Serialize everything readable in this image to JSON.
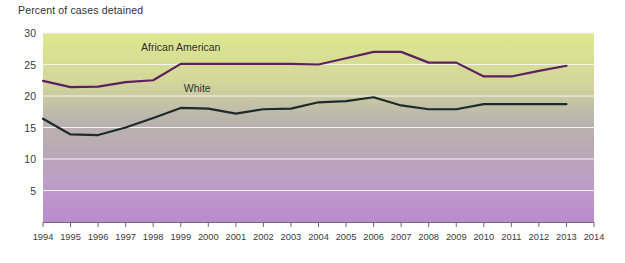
{
  "chart_data": {
    "type": "line",
    "title": "Percent of cases detained",
    "xlabel": "",
    "ylabel": "Percent of cases detained",
    "grid": true,
    "legend_position": "inline-labels",
    "xlim": [
      1994,
      2014
    ],
    "ylim": [
      0,
      30
    ],
    "yticks": [
      5,
      10,
      15,
      20,
      25,
      30
    ],
    "ytick_labels": [
      "5",
      "10",
      "15",
      "20",
      "25",
      "30"
    ],
    "x": [
      1994,
      1995,
      1996,
      1997,
      1998,
      1999,
      2000,
      2001,
      2002,
      2003,
      2004,
      2005,
      2006,
      2007,
      2008,
      2009,
      2010,
      2011,
      2012,
      2013,
      2014
    ],
    "xtick_labels": [
      "1994",
      "1995",
      "1996",
      "1997",
      "1998",
      "1999",
      "2000",
      "2001",
      "2002",
      "2003",
      "2004",
      "2005",
      "2006",
      "2007",
      "2008",
      "2009",
      "2010",
      "2011",
      "2012",
      "2013",
      "2014"
    ],
    "series": [
      {
        "name": "African American",
        "color": "#5e2060",
        "values": [
          22.4,
          21.4,
          21.5,
          22.2,
          22.5,
          25.1,
          25.1,
          25.1,
          25.1,
          25.1,
          25.0,
          26.0,
          27.0,
          27.0,
          25.3,
          25.3,
          23.1,
          23.1,
          24.0,
          24.8,
          null
        ]
      },
      {
        "name": "White",
        "color": "#1d2b2b",
        "values": [
          16.4,
          13.9,
          13.8,
          15.0,
          16.5,
          18.1,
          18.0,
          17.2,
          17.9,
          18.0,
          19.0,
          19.2,
          19.8,
          18.5,
          17.9,
          17.9,
          18.7,
          18.7,
          18.7,
          18.7,
          null
        ]
      }
    ],
    "annotations": [
      {
        "text": "African American",
        "x": 1999.0,
        "y": 27.2
      },
      {
        "text": "White",
        "x": 1999.6,
        "y": 20.6
      }
    ]
  },
  "style": {
    "gradient_top": "#dbe58c",
    "gradient_mid": "#b9b2ac",
    "gradient_bottom": "#bb8fcd",
    "gridline_color": "#f2f2f2",
    "axis_color": "#6b6b6b",
    "background": "#ffffff"
  }
}
